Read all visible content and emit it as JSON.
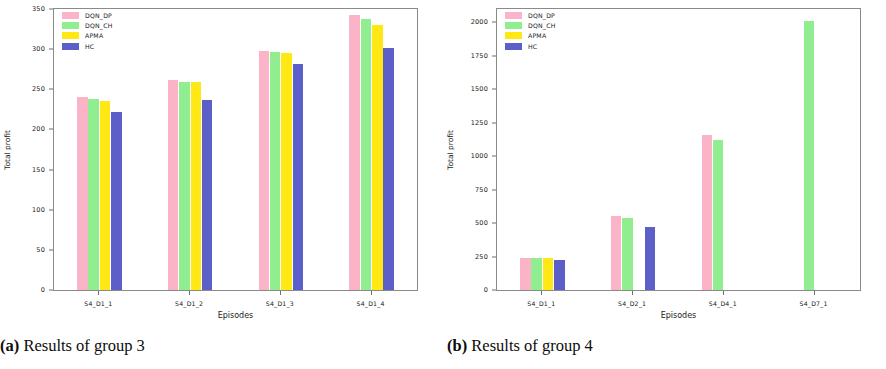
{
  "figure": {
    "panels": [
      {
        "id": "panel-a",
        "caption_prefix": "(a)",
        "caption_text": "Results of group 3",
        "chart_data": {
          "type": "bar",
          "title": "",
          "xlabel": "Episodes",
          "ylabel": "Total profit",
          "categories": [
            "S4_D1_1",
            "S4_D1_2",
            "S4_D1_3",
            "S4_D1_4"
          ],
          "ylim": [
            0,
            350
          ],
          "yticks": [
            0,
            50,
            100,
            150,
            200,
            250,
            300,
            350
          ],
          "grid": false,
          "legend_position": "upper left",
          "series": [
            {
              "name": "DQN_DP",
              "color": "#FBB4C7",
              "values": [
                241,
                262,
                298,
                342
              ]
            },
            {
              "name": "DQN_CH",
              "color": "#90EE90",
              "values": [
                238,
                259,
                297,
                337
              ]
            },
            {
              "name": "APMA",
              "color": "#FFE814",
              "values": [
                236,
                259,
                295,
                330
              ]
            },
            {
              "name": "HC",
              "color": "#5B5FC7",
              "values": [
                222,
                237,
                281,
                301
              ]
            }
          ]
        }
      },
      {
        "id": "panel-b",
        "caption_prefix": "(b)",
        "caption_text": "Results of group 4",
        "chart_data": {
          "type": "bar",
          "title": "",
          "xlabel": "Episodes",
          "ylabel": "Total profit",
          "categories": [
            "S4_D1_1",
            "S4_D2_1",
            "S4_D4_1",
            "S4_D7_1"
          ],
          "ylim": [
            0,
            2100
          ],
          "yticks": [
            0,
            250,
            500,
            750,
            1000,
            1250,
            1500,
            1750,
            2000
          ],
          "grid": false,
          "legend_position": "upper left",
          "series": [
            {
              "name": "DQN_DP",
              "color": "#FBB4C7",
              "values": [
                240,
                550,
                1160,
                null
              ]
            },
            {
              "name": "DQN_CH",
              "color": "#90EE90",
              "values": [
                240,
                535,
                1120,
                2010
              ]
            },
            {
              "name": "APMA",
              "color": "#FFE814",
              "values": [
                240,
                null,
                null,
                null
              ]
            },
            {
              "name": "HC",
              "color": "#5B5FC7",
              "values": [
                225,
                470,
                null,
                null
              ]
            }
          ]
        }
      }
    ]
  }
}
